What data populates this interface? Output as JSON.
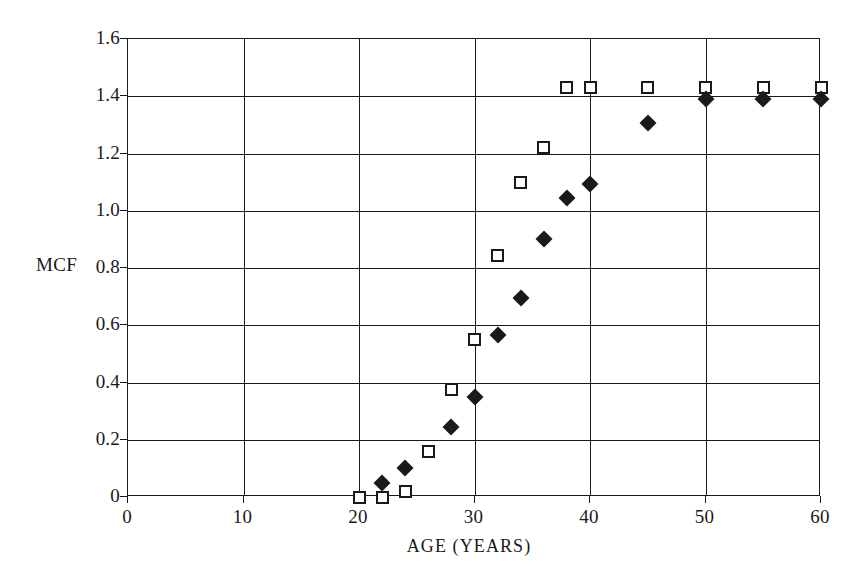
{
  "chart_data": {
    "type": "scatter",
    "title": "",
    "xlabel": "AGE (YEARS)",
    "ylabel": "MCF",
    "xlim": [
      0,
      60
    ],
    "ylim": [
      0,
      1.6
    ],
    "xticks": [
      0,
      10,
      20,
      30,
      40,
      50,
      60
    ],
    "xtick_labels": [
      "0",
      "10",
      "20",
      "30",
      "40",
      "50",
      "60"
    ],
    "yticks": [
      0,
      0.2,
      0.4,
      0.6,
      0.8,
      1.0,
      1.2,
      1.4,
      1.6
    ],
    "ytick_labels": [
      "0",
      "0.2",
      "0.4",
      "0.6",
      "0.8",
      "1.0",
      "1.2",
      "1.4",
      "1.6"
    ],
    "grid": true,
    "legend": "none",
    "marker_color": "#1a1a1a",
    "background": "#ffffff",
    "series": [
      {
        "name": "open-square-series",
        "marker": "square",
        "fill": "open",
        "points": [
          {
            "x": 20,
            "y": 0.0
          },
          {
            "x": 22,
            "y": 0.0
          },
          {
            "x": 24,
            "y": 0.02
          },
          {
            "x": 26,
            "y": 0.16
          },
          {
            "x": 28,
            "y": 0.375
          },
          {
            "x": 30,
            "y": 0.55
          },
          {
            "x": 32,
            "y": 0.845
          },
          {
            "x": 34,
            "y": 1.1
          },
          {
            "x": 36,
            "y": 1.22
          },
          {
            "x": 38,
            "y": 1.43
          },
          {
            "x": 40,
            "y": 1.43
          },
          {
            "x": 45,
            "y": 1.43
          },
          {
            "x": 50,
            "y": 1.43
          },
          {
            "x": 55,
            "y": 1.43
          },
          {
            "x": 60,
            "y": 1.43
          }
        ]
      },
      {
        "name": "filled-diamond-series",
        "marker": "diamond",
        "fill": "filled",
        "points": [
          {
            "x": 22,
            "y": 0.05
          },
          {
            "x": 24,
            "y": 0.1
          },
          {
            "x": 28,
            "y": 0.245
          },
          {
            "x": 30,
            "y": 0.35
          },
          {
            "x": 32,
            "y": 0.565
          },
          {
            "x": 34,
            "y": 0.695
          },
          {
            "x": 36,
            "y": 0.9
          },
          {
            "x": 38,
            "y": 1.045
          },
          {
            "x": 40,
            "y": 1.095
          },
          {
            "x": 45,
            "y": 1.305
          },
          {
            "x": 50,
            "y": 1.39
          },
          {
            "x": 55,
            "y": 1.39
          },
          {
            "x": 60,
            "y": 1.39
          }
        ]
      }
    ]
  }
}
